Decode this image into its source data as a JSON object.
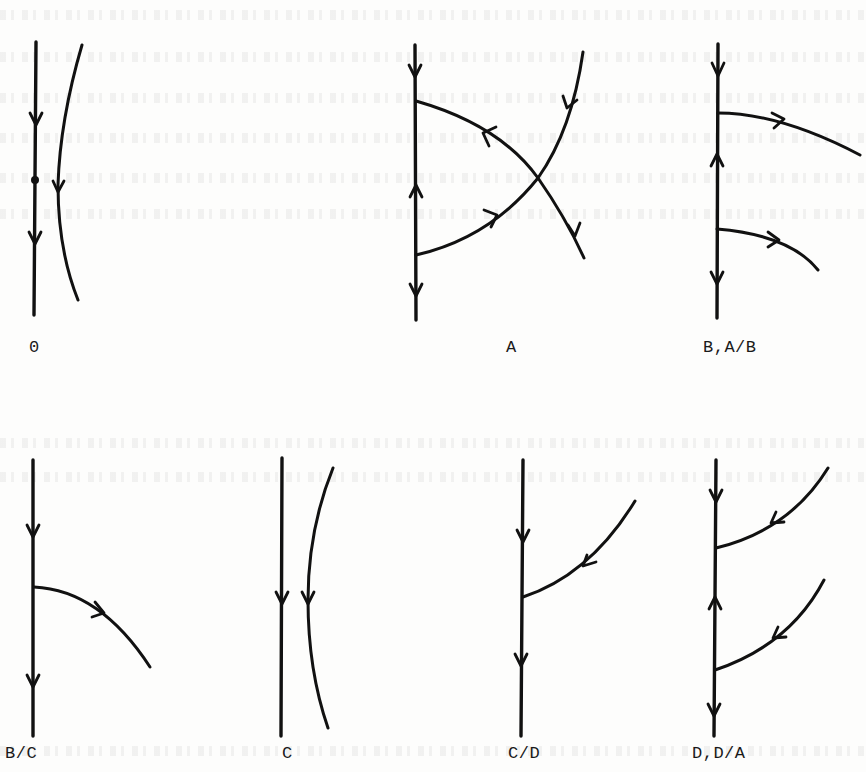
{
  "figure": {
    "type": "phase-portrait-panel-grid",
    "rows": 2,
    "columns": 4,
    "panels": [
      {
        "id": "panel-0",
        "label": "0",
        "row": 0,
        "col": 0,
        "elements": [
          "vertical axis with downward arrows",
          "fixed point on axis",
          "curved trajectory with downward arrow"
        ]
      },
      {
        "id": "panel-A",
        "label": "A",
        "row": 0,
        "col": 1,
        "elements": [
          "vertical axis: down arrow top, up arrow middle, down arrow bottom",
          "two curved separatrices crossing at a saddle"
        ]
      },
      {
        "id": "panel-B-AB",
        "label": "B,A/B",
        "row": 0,
        "col": 2,
        "elements": [
          "vertical axis: down arrow top, up arrow middle, down arrow bottom",
          "two trajectories leaving axis to the right"
        ]
      },
      {
        "id": "panel-BC",
        "label": "B/C",
        "row": 1,
        "col": 0,
        "elements": [
          "vertical axis with downward arrows",
          "one trajectory leaving axis to the right"
        ]
      },
      {
        "id": "panel-C",
        "label": "C",
        "row": 1,
        "col": 1,
        "elements": [
          "vertical axis with downward arrow",
          "curved trajectory with downward arrow"
        ]
      },
      {
        "id": "panel-CD",
        "label": "C/D",
        "row": 1,
        "col": 2,
        "elements": [
          "vertical axis with downward arrows",
          "one trajectory entering axis from the upper right"
        ]
      },
      {
        "id": "panel-D-DA",
        "label": "D,D/A",
        "row": 1,
        "col": 3,
        "elements": [
          "vertical axis: down arrow top, up arrow middle, down arrow bottom",
          "two trajectories entering axis from the upper right"
        ]
      }
    ]
  },
  "labels": {
    "p0": "0",
    "pA": "A",
    "pB": "B,A/B",
    "pBC": "B/C",
    "pC": "C",
    "pCD": "C/D",
    "pD": "D,D/A"
  },
  "colors": {
    "ink": "#111111",
    "paper": "#fdfdfc"
  }
}
